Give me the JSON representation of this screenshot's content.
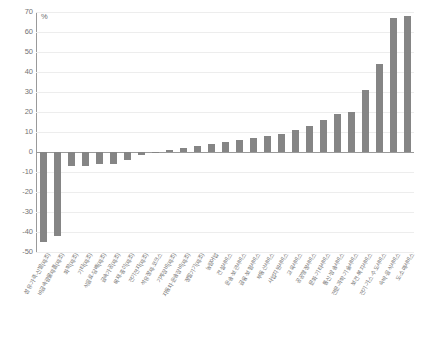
{
  "chart_data": {
    "type": "bar",
    "title": "",
    "xlabel": "",
    "ylabel": "%",
    "unit": "%",
    "ylim": [
      -50,
      70
    ],
    "ytick_step": 10,
    "yticks": [
      70,
      60,
      50,
      40,
      30,
      20,
      10,
      0,
      -10,
      -20,
      -30,
      -40,
      -50
    ],
    "grid": true,
    "legend": "none",
    "bar_color": "#858585",
    "axis_color": "#9a9a9a",
    "grid_color": "#ededed",
    "categories": [
      "섬유·가죽·신발(제조)",
      "비금속광물제품(제조)",
      "화학(제조)",
      "기타(제조)",
      "식음료·담배(제조)",
      "금속가공(제조)",
      "목재·종이(제조)",
      "전기전자(제조)",
      "석유정제·코크스",
      "기계장비(제조)",
      "운송·보관서비스",
      "자동차·운송장비(제조)",
      "금융·보험서비스",
      "정밀기기(제조)",
      "건설서비스",
      "부동산서비스",
      "교육서비스",
      "공공행정서비스",
      "문화·기타서비스",
      "통신·방송서비스",
      "전기·가스·수도서비스",
      "보건·복지서비스",
      "전문·과학·기술서비스",
      "농림어업",
      "사업지원서비스",
      "숙박·음식서비스",
      "도·소매서비스"
    ],
    "values": [
      -45,
      -42,
      -7,
      -7,
      -6,
      -6,
      -4,
      -1.5,
      -0.3,
      1,
      2,
      3,
      5,
      7,
      8,
      11,
      13,
      16,
      19,
      20,
      31,
      44,
      67,
      68,
      4,
      6,
      9
    ],
    "series": [
      {
        "name": "증감률",
        "values": [
          -45,
          -42,
          -7,
          -7,
          -6,
          -6,
          -4,
          -1.5,
          -0.3,
          1,
          2,
          3,
          5,
          7,
          8,
          11,
          13,
          16,
          19,
          20,
          31,
          44,
          67,
          68,
          4,
          6,
          9
        ]
      }
    ]
  },
  "bars": [
    {
      "label": "섬유·가죽·신발(제조)",
      "value": -45
    },
    {
      "label": "비금속광물제품(제조)",
      "value": -42
    },
    {
      "label": "화학(제조)",
      "value": -7
    },
    {
      "label": "기타(제조)",
      "value": -7
    },
    {
      "label": "식음료·담배(제조)",
      "value": -6
    },
    {
      "label": "금속가공(제조)",
      "value": -6
    },
    {
      "label": "목재·종이(제조)",
      "value": -4
    },
    {
      "label": "전기전자(제조)",
      "value": -1.5
    },
    {
      "label": "석유정제·코크스",
      "value": -0.3
    },
    {
      "label": "기계장비(제조)",
      "value": 1
    },
    {
      "label": "자동차·운송장비(제조)",
      "value": 2
    },
    {
      "label": "정밀기기(제조)",
      "value": 3
    },
    {
      "label": "농림어업",
      "value": 4
    },
    {
      "label": "건설서비스",
      "value": 5
    },
    {
      "label": "운송·보관서비스",
      "value": 6
    },
    {
      "label": "금융·보험서비스",
      "value": 7
    },
    {
      "label": "부동산서비스",
      "value": 8
    },
    {
      "label": "사업지원서비스",
      "value": 9
    },
    {
      "label": "교육서비스",
      "value": 11
    },
    {
      "label": "공공행정서비스",
      "value": 13
    },
    {
      "label": "문화·기타서비스",
      "value": 16
    },
    {
      "label": "통신·방송서비스",
      "value": 19
    },
    {
      "label": "전문·과학·기술서비스",
      "value": 20
    },
    {
      "label": "보건·복지서비스",
      "value": 31
    },
    {
      "label": "전기·가스·수도서비스",
      "value": 44
    },
    {
      "label": "숙박·음식서비스",
      "value": 67
    },
    {
      "label": "도·소매서비스",
      "value": 68
    }
  ],
  "axis": {
    "unit_label": "%",
    "y_max": 70,
    "y_min": -50,
    "step": 10
  }
}
